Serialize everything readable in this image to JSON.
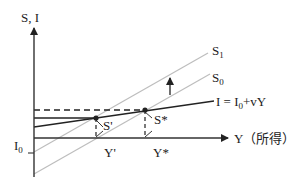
{
  "diagram": {
    "type": "savings-investment model",
    "axes": {
      "y_label": "S, I",
      "x_label": "Y（所得）"
    },
    "curves": [
      {
        "id": "S1",
        "label_main": "S",
        "label_sub": "1",
        "color": "#bdbdbd"
      },
      {
        "id": "S0",
        "label_main": "S",
        "label_sub": "0",
        "color": "#bdbdbd"
      },
      {
        "id": "I",
        "label": "I = I",
        "label_sub": "0",
        "label_tail": "+vY",
        "color": "#222222"
      }
    ],
    "points": [
      {
        "id": "S-prime",
        "label": "S'"
      },
      {
        "id": "S-star",
        "label": "S*"
      }
    ],
    "x_ticks": [
      {
        "id": "Y-prime",
        "label": "Y'"
      },
      {
        "id": "Y-star",
        "label": "Y*"
      }
    ],
    "y_ticks": [
      {
        "id": "I0",
        "label_main": "I",
        "label_sub": "0"
      }
    ],
    "shift_arrow": {
      "direction": "up",
      "meaning": "S0 shifts to S1"
    }
  }
}
